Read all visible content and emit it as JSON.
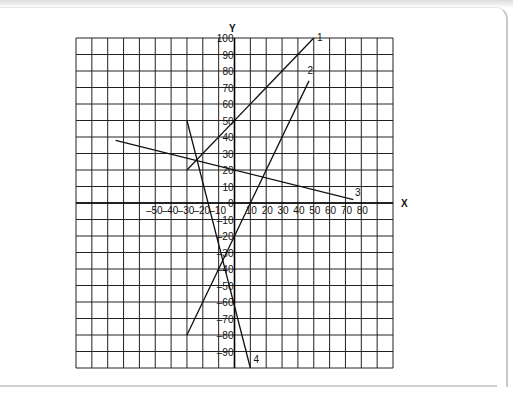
{
  "chart_data": {
    "type": "line",
    "title": "",
    "xlabel": "X",
    "ylabel": "Y",
    "xlim": [
      -100,
      100
    ],
    "ylim": [
      -100,
      100
    ],
    "grid": true,
    "grid_step": 10,
    "x_tick_labels": [
      "-50",
      "-40",
      "-30",
      "-20",
      "-10",
      "0",
      "10",
      "20",
      "30",
      "40",
      "50",
      "60",
      "70",
      "80"
    ],
    "y_tick_labels": [
      "100",
      "90",
      "80",
      "70",
      "60",
      "50",
      "40",
      "30",
      "20",
      "10",
      "0",
      "-10",
      "-20",
      "-30",
      "-40",
      "-50",
      "-60",
      "-70",
      "-80",
      "-90"
    ],
    "series": [
      {
        "name": "1",
        "points": [
          [
            -30,
            20
          ],
          [
            50,
            100
          ]
        ],
        "equation": "y = x + 50"
      },
      {
        "name": "2",
        "points": [
          [
            -30,
            -80
          ],
          [
            47,
            74
          ]
        ],
        "equation": "y = 2x - 20"
      },
      {
        "name": "3",
        "points": [
          [
            -75,
            38
          ],
          [
            75,
            2
          ]
        ],
        "equation": "y ≈ -0.24x + 20"
      },
      {
        "name": "4",
        "points": [
          [
            -30,
            50
          ],
          [
            10,
            -100
          ]
        ],
        "equation": "y ≈ -3.75x - 62.5"
      }
    ],
    "line_labels": [
      {
        "text": "1",
        "at": [
          52,
          98
        ]
      },
      {
        "text": "2",
        "at": [
          46,
          78
        ]
      },
      {
        "text": "3",
        "at": [
          76,
          4
        ]
      },
      {
        "text": "4",
        "at": [
          12,
          -97
        ]
      }
    ]
  }
}
